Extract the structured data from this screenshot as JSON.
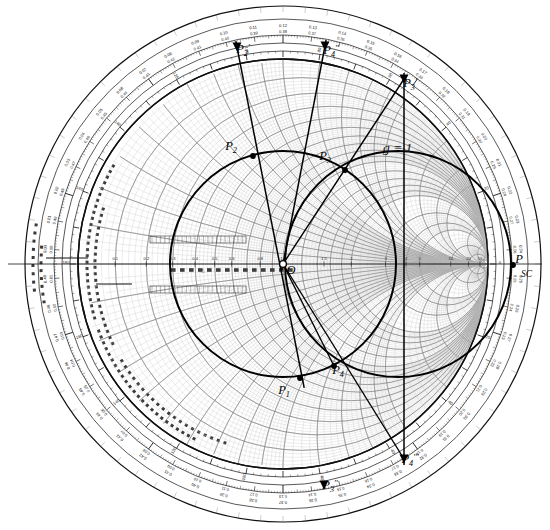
{
  "figure": {
    "kind": "smith-chart",
    "title": "",
    "background": "#ffffff",
    "ink": "#111111",
    "grid_light": "#9a9a9a",
    "grid_mid": "#6f6f6f",
    "heavy": "#000000"
  },
  "geometry": {
    "center": {
      "x": 283,
      "y": 264,
      "label": "O"
    },
    "chart_radius": 205,
    "ring_radii": [
      205,
      213,
      221,
      229,
      245,
      258
    ],
    "outer_border_radius": 258
  },
  "chart_data": {
    "type": "scatter",
    "xlabel": "",
    "ylabel": "",
    "points": [
      {
        "name": "O",
        "label": "O",
        "x": 283,
        "y": 264,
        "marker": "open-circle",
        "label_dx": 8,
        "label_dy": 10
      },
      {
        "name": "P1",
        "label": "P1",
        "x": 300,
        "y": 378,
        "marker": "dot",
        "label_dx": -16,
        "label_dy": 16
      },
      {
        "name": "P2",
        "label": "P2",
        "x": 253,
        "y": 156,
        "marker": "dot",
        "label_dx": -22,
        "label_dy": -6
      },
      {
        "name": "P3",
        "label": "P3",
        "x": 345,
        "y": 170,
        "marker": "dot",
        "label_dx": -20,
        "label_dy": -10
      },
      {
        "name": "P4",
        "label": "P4",
        "x": 334,
        "y": 366,
        "marker": "dot",
        "label_dx": 4,
        "label_dy": 8
      },
      {
        "name": "P5",
        "label": "P",
        "x": 513,
        "y": 265,
        "marker": "dot",
        "label_dx": 6,
        "label_dy": -2
      },
      {
        "name": "P2p",
        "label": "P2",
        "x": 237,
        "y": 47,
        "marker": "wedge",
        "label_dx": 6,
        "label_dy": 6
      },
      {
        "name": "P4p",
        "label": "P4",
        "x": 325,
        "y": 46,
        "marker": "wedge",
        "label_dx": 6,
        "label_dy": 8
      },
      {
        "name": "P3p",
        "label": "P3",
        "x": 404,
        "y": 79,
        "marker": "wedge",
        "label_dx": 6,
        "label_dy": 8
      },
      {
        "name": "P4pp",
        "label": "P4",
        "x": 404,
        "y": 459,
        "marker": "wedge",
        "label_dx": 6,
        "label_dy": 4
      },
      {
        "name": "P3pp",
        "label": "P3",
        "x": 324,
        "y": 485,
        "marker": "wedge",
        "label_dx": 6,
        "label_dy": 4
      }
    ],
    "point_primes": {
      "P2p": "'",
      "P4p": "''",
      "P3p": "'",
      "P4pp": "'''",
      "P3pp": "''"
    },
    "annotations": [
      {
        "name": "g-equals-1",
        "text": "g = 1",
        "x": 383,
        "y": 152
      },
      {
        "name": "sc-label",
        "text": "SC",
        "x": 521,
        "y": 277
      }
    ],
    "construction_lines": [
      {
        "name": "radial-P2",
        "from": [
          237,
          47
        ],
        "to": [
          303,
          382
        ]
      },
      {
        "name": "radial-P4",
        "from": [
          325,
          46
        ],
        "to": [
          283,
          264
        ]
      },
      {
        "name": "radial-P3",
        "from": [
          404,
          79
        ],
        "to": [
          404,
          459
        ]
      }
    ],
    "circles": [
      {
        "name": "vswr-circle",
        "cx": 283,
        "cy": 264,
        "r": 113,
        "stroke_width": 2.0
      },
      {
        "name": "g-equals-1-circle",
        "cx": 398,
        "cy": 264,
        "r": 113,
        "stroke_width": 2.0
      }
    ],
    "outer_scale": {
      "name": "wavelengths-toward-generator",
      "labels_outer": [
        "0.12",
        "0.13",
        "0.14",
        "0.15",
        "0.16",
        "0.17",
        "0.18",
        "0.19",
        "0.20",
        "0.21",
        "0.22",
        "0.23",
        "0.24",
        "0.25",
        "0.26",
        "0.27",
        "0.28",
        "0.29",
        "0.30",
        "0.31",
        "0.32",
        "0.33",
        "0.34",
        "0.35",
        "0.36",
        "0.37",
        "0.38",
        "0.39",
        "0.40",
        "0.41",
        "0.42",
        "0.43",
        "0.44",
        "0.45",
        "0.46",
        "0.47",
        "0.48",
        "0.49",
        "0.00",
        "0.01",
        "0.02",
        "0.03",
        "0.04",
        "0.05",
        "0.06",
        "0.07",
        "0.08",
        "0.09",
        "0.10",
        "0.11"
      ],
      "labels_inner": [
        "0.38",
        "0.37",
        "0.36",
        "0.35",
        "0.34",
        "0.33",
        "0.32",
        "0.31",
        "0.30",
        "0.29",
        "0.28",
        "0.27",
        "0.26",
        "0.25",
        "0.24",
        "0.23",
        "0.22",
        "0.21",
        "0.20",
        "0.19",
        "0.18",
        "0.17",
        "0.16",
        "0.15",
        "0.14",
        "0.13",
        "0.12",
        "0.11",
        "0.10",
        "0.09",
        "0.08",
        "0.07",
        "0.06",
        "0.05",
        "0.04",
        "0.03",
        "0.02",
        "0.01",
        "0.00",
        "0.49",
        "0.48",
        "0.47",
        "0.46",
        "0.45",
        "0.44",
        "0.43",
        "0.42",
        "0.41",
        "0.40",
        "0.39"
      ],
      "start_angle_deg": 90,
      "direction": "clockwise"
    },
    "angle_scale": {
      "name": "angle-of-reflection-coefficient-degrees",
      "labels": [
        "0",
        "20",
        "40",
        "60",
        "80",
        "100",
        "120",
        "140",
        "160",
        "180",
        "-160",
        "-140",
        "-120",
        "-100",
        "-80",
        "-60",
        "-40",
        "-20"
      ]
    },
    "resistance_circles": [
      0.1,
      0.2,
      0.3,
      0.4,
      0.5,
      0.6,
      0.7,
      0.8,
      0.9,
      1.0,
      1.2,
      1.4,
      1.6,
      1.8,
      2.0,
      3.0,
      4.0,
      5.0,
      10.0,
      20.0,
      50.0
    ],
    "reactance_arcs": [
      0.1,
      0.2,
      0.3,
      0.4,
      0.5,
      0.6,
      0.7,
      0.8,
      0.9,
      1.0,
      1.2,
      1.4,
      1.6,
      1.8,
      2.0,
      3.0,
      4.0,
      5.0,
      10.0,
      20.0,
      50.0
    ],
    "axis_tick_labels": [
      "0.1",
      "0.2",
      "0.3",
      "0.4",
      "0.5",
      "0.6",
      "0.8",
      "1.0",
      "1.5",
      "2",
      "3",
      "4",
      "5",
      "10",
      "20",
      "50"
    ],
    "radial_legend_texts": [
      "RADIALLY SCALED PARAMETERS",
      "TOWARD LOAD",
      "TOWARD GENERATOR",
      "CENTER"
    ]
  }
}
